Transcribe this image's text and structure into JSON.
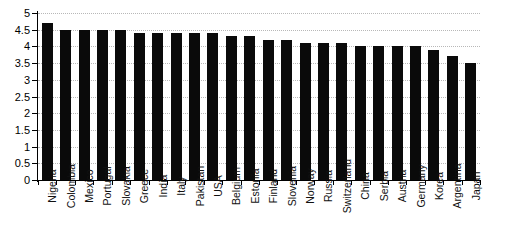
{
  "chart_data": {
    "type": "bar",
    "title": "",
    "xlabel": "",
    "ylabel": "",
    "ylim": [
      0,
      5
    ],
    "ytick_step": 0.5,
    "grid": true,
    "legend": null,
    "bar_color": "#0a0a0a",
    "background": "#ffffff",
    "gridline_color": "#b8b8b8",
    "categories": [
      "Nigeria",
      "Colombia",
      "Mexico",
      "Portugal",
      "Slovakia",
      "Greece",
      "India",
      "Italy",
      "Pakistan",
      "USA",
      "Belgium",
      "Estonia",
      "Finland",
      "Slovenia",
      "Norway",
      "Russia",
      "Switzerland",
      "China",
      "Serbia",
      "Austria",
      "Germany",
      "Korea",
      "Argentina",
      "Japan"
    ],
    "values": [
      4.7,
      4.5,
      4.5,
      4.5,
      4.5,
      4.4,
      4.4,
      4.4,
      4.4,
      4.4,
      4.3,
      4.3,
      4.2,
      4.2,
      4.1,
      4.1,
      4.1,
      4.0,
      4.0,
      4.0,
      4.0,
      3.9,
      3.7,
      3.5
    ],
    "ytick_labels": [
      "0",
      "0.5",
      "1",
      "1.5",
      "2",
      "2.5",
      "3",
      "3.5",
      "4",
      "4.5",
      "5"
    ],
    "ytick_values": [
      0,
      0.5,
      1,
      1.5,
      2,
      2.5,
      3,
      3.5,
      4,
      4.5,
      5
    ]
  }
}
